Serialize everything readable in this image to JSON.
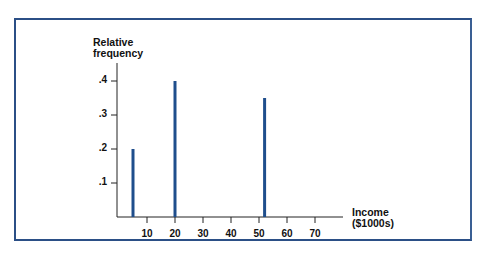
{
  "chart_data": {
    "type": "bar",
    "title": "",
    "xlabel": "Income ($1000s)",
    "ylabel": "Relative frequency",
    "x": [
      5,
      20,
      52
    ],
    "values": [
      0.2,
      0.4,
      0.35
    ],
    "xlim": [
      0,
      80
    ],
    "ylim": [
      0,
      0.45
    ],
    "x_ticks": [
      "10",
      "20",
      "30",
      "40",
      "50",
      "60",
      "70"
    ],
    "y_ticks": [
      ".1",
      ".2",
      ".3",
      ".4"
    ],
    "grid": false,
    "bar_color": "#1f4e8c",
    "frame_color": "#2b4f86"
  },
  "labels": {
    "y_line1": "Relative",
    "y_line2": "frequency",
    "x_line1": "Income",
    "x_line2": "($1000s)"
  }
}
